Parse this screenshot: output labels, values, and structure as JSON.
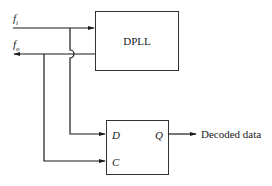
{
  "diagram": {
    "inputs": {
      "fi": {
        "base": "f",
        "sub": "i"
      },
      "fo": {
        "base": "f",
        "sub": "o"
      }
    },
    "dpll": {
      "label": "DPLL"
    },
    "flipflop": {
      "d_pin": "D",
      "c_pin": "C",
      "q_pin": "Q"
    },
    "output": {
      "label": "Decoded data"
    },
    "colors": {
      "line": "#1a1a1a",
      "box": "#333333"
    }
  }
}
